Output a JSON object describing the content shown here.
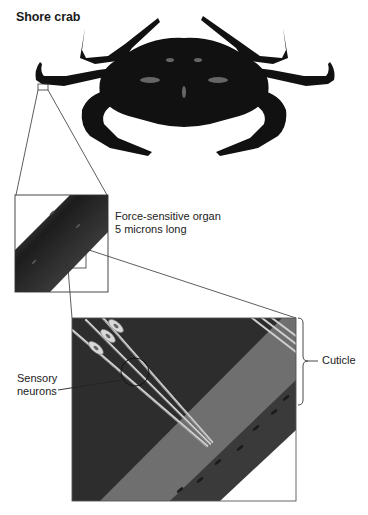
{
  "figure": {
    "title": "Shore crab",
    "panels": [
      {
        "id": "whole-crab",
        "description": "Photograph of a shore crab, dorsal view"
      },
      {
        "id": "leg-segment",
        "description": "Magnified leg segment"
      },
      {
        "id": "organ-closeup",
        "description": "Cross-section of cuticle with sensory neurons"
      }
    ],
    "labels": {
      "organ_line1": "Force-sensitive organ",
      "organ_line2": "5 microns long",
      "sensory_line1": "Sensory",
      "sensory_line2": "neurons",
      "cuticle": "Cuticle"
    },
    "colors": {
      "crab": "#111111",
      "outline": "#333333",
      "bg_dark": "#2e2e2e",
      "cuticle_band": "#6f6f6f",
      "neuron": "#d8d8d8"
    }
  }
}
